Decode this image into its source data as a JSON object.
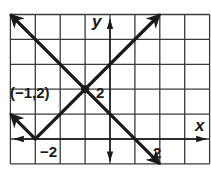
{
  "chart_data": {
    "type": "line",
    "title": "",
    "xlabel": "x",
    "ylabel": "y",
    "xlim": [
      -4,
      4
    ],
    "ylim": [
      -1,
      5
    ],
    "grid": true,
    "grid_step": 1,
    "tick_labels": {
      "x": [
        {
          "value": -2,
          "label": "−2"
        },
        {
          "value": 2,
          "label": "2"
        }
      ],
      "y": [
        {
          "value": 2,
          "label": "2"
        }
      ]
    },
    "series": [
      {
        "name": "absolute value graph y = |x + 3|",
        "points": [
          [
            -4,
            1
          ],
          [
            -3,
            0
          ],
          [
            2,
            5
          ]
        ],
        "arrows": [
          "start",
          "end"
        ]
      },
      {
        "name": "line y = -x + 1",
        "points": [
          [
            -4,
            5
          ],
          [
            2,
            -1
          ]
        ],
        "arrows": [
          "start",
          "end"
        ]
      }
    ],
    "annotations": [
      {
        "point": [
          -1,
          2
        ],
        "label": "(−1,2)",
        "marker": "filled-dot"
      }
    ]
  },
  "labels": {
    "x_axis": "x",
    "y_axis": "y",
    "x_tick_neg2": "−2",
    "x_tick_2": "2",
    "y_tick_2": "2",
    "point": "(−1,2)"
  },
  "colors": {
    "ink": "#1a1a1a",
    "grid": "#3a3a3a",
    "background": "#ffffff"
  }
}
